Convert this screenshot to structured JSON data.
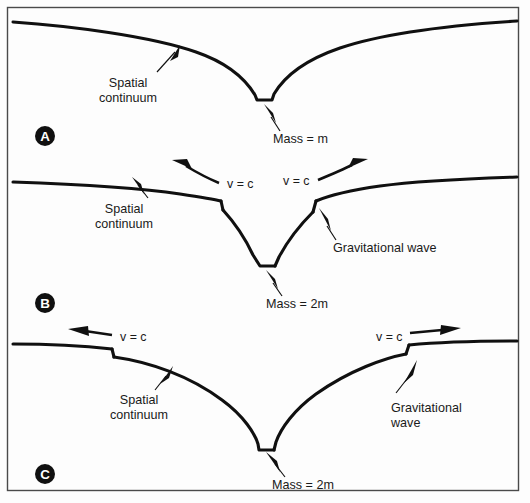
{
  "figure": {
    "background_color": "#fdfdfd",
    "line_color": "#101010",
    "frame_color": "#4a4a4a",
    "width": 530,
    "height": 503
  },
  "panels": [
    {
      "id": "A",
      "marker_label": "A",
      "marker": {
        "cx": 45,
        "cy": 136,
        "r": 10
      },
      "labels": {
        "continuum": {
          "line1": "Spatial",
          "line2": "continuum",
          "x": 128,
          "y": 87
        },
        "mass": {
          "text": "Mass = m",
          "x": 273,
          "y": 143
        }
      },
      "wave_labels": [],
      "well_depth": "shallow",
      "mass_value": "m"
    },
    {
      "id": "B",
      "marker_label": "B",
      "marker": {
        "cx": 45,
        "cy": 303,
        "r": 10
      },
      "labels": {
        "continuum": {
          "line1": "Spatial",
          "line2": "continuum",
          "x": 124,
          "y": 213
        },
        "mass": {
          "text": "Mass = 2m",
          "x": 266,
          "y": 308
        },
        "wave": {
          "line1": "Gravitational wave",
          "line2": "",
          "x": 333,
          "y": 252
        }
      },
      "wave_labels": [
        {
          "text": "v = c",
          "x": 227,
          "y": 188,
          "direction": "left"
        },
        {
          "text": "v = c",
          "x": 285,
          "y": 185,
          "direction": "right"
        }
      ],
      "well_depth": "deep",
      "mass_value": "2m"
    },
    {
      "id": "C",
      "marker_label": "C",
      "marker": {
        "cx": 45,
        "cy": 474,
        "r": 10
      },
      "labels": {
        "continuum": {
          "line1": "Spatial",
          "line2": "continuum",
          "x": 124,
          "y": 404
        },
        "mass": {
          "text": "Mass = 2m",
          "x": 272,
          "y": 489
        },
        "wave": {
          "line1": "Gravitational",
          "line2": "wave",
          "x": 391,
          "y": 412
        }
      },
      "wave_labels": [
        {
          "text": "v = c",
          "x": 120,
          "y": 341,
          "direction": "left"
        },
        {
          "text": "v = c",
          "x": 376,
          "y": 341,
          "direction": "right"
        }
      ],
      "well_depth": "deepest",
      "mass_value": "2m"
    }
  ]
}
